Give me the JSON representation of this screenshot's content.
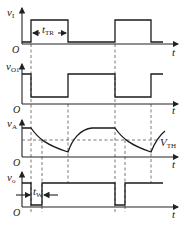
{
  "diagram": {
    "type": "timing-waveforms",
    "panels": [
      {
        "id": "vI",
        "label": "v",
        "sub": "I",
        "origin": "O",
        "t_label": "t",
        "annotation": {
          "label": "t",
          "sub": "TR"
        }
      },
      {
        "id": "vO1",
        "label": "v",
        "sub": "O1",
        "origin": "O",
        "t_label": "t"
      },
      {
        "id": "vA",
        "label": "v",
        "sub": "A",
        "origin": "O",
        "t_label": "t",
        "threshold": {
          "label": "V",
          "sub": "TH"
        }
      },
      {
        "id": "vO",
        "label": "v",
        "sub": "o",
        "origin": "O",
        "t_label": "t",
        "annotation": {
          "label": "t",
          "sub": "W"
        }
      }
    ]
  }
}
